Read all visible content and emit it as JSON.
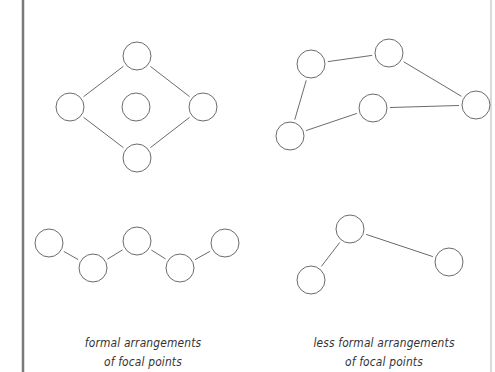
{
  "diagram": {
    "stroke_color": "#6b6b6b",
    "border_color": "#7a7a7a",
    "circle_radius": 14,
    "panels": [
      {
        "id": "formal-top",
        "nodes": [
          [
            137,
            56
          ],
          [
            70,
            107
          ],
          [
            136,
            107
          ],
          [
            203,
            107
          ],
          [
            137,
            158
          ]
        ],
        "edges": [
          [
            0,
            1
          ],
          [
            0,
            3
          ],
          [
            1,
            4
          ],
          [
            3,
            4
          ]
        ]
      },
      {
        "id": "less-formal-top",
        "nodes": [
          [
            311,
            64
          ],
          [
            389,
            53
          ],
          [
            476,
            105
          ],
          [
            373,
            108
          ],
          [
            290,
            136
          ]
        ],
        "edges": [
          [
            0,
            1
          ],
          [
            1,
            2
          ],
          [
            2,
            3
          ],
          [
            3,
            4
          ],
          [
            4,
            0
          ]
        ]
      },
      {
        "id": "formal-bottom",
        "nodes": [
          [
            49,
            243
          ],
          [
            93,
            268
          ],
          [
            137,
            241
          ],
          [
            180,
            268
          ],
          [
            225,
            243
          ]
        ],
        "edges": [
          [
            0,
            1
          ],
          [
            1,
            2
          ],
          [
            2,
            3
          ],
          [
            3,
            4
          ]
        ]
      },
      {
        "id": "less-formal-bottom",
        "nodes": [
          [
            350,
            229
          ],
          [
            311,
            280
          ],
          [
            449,
            262
          ]
        ],
        "edges": [
          [
            0,
            1
          ],
          [
            0,
            2
          ]
        ]
      }
    ],
    "captions": {
      "left": {
        "line1": "formal arrangements",
        "line2": "of focal points"
      },
      "right": {
        "line1": "less formal arrangements",
        "line2": "of focal points"
      }
    }
  }
}
